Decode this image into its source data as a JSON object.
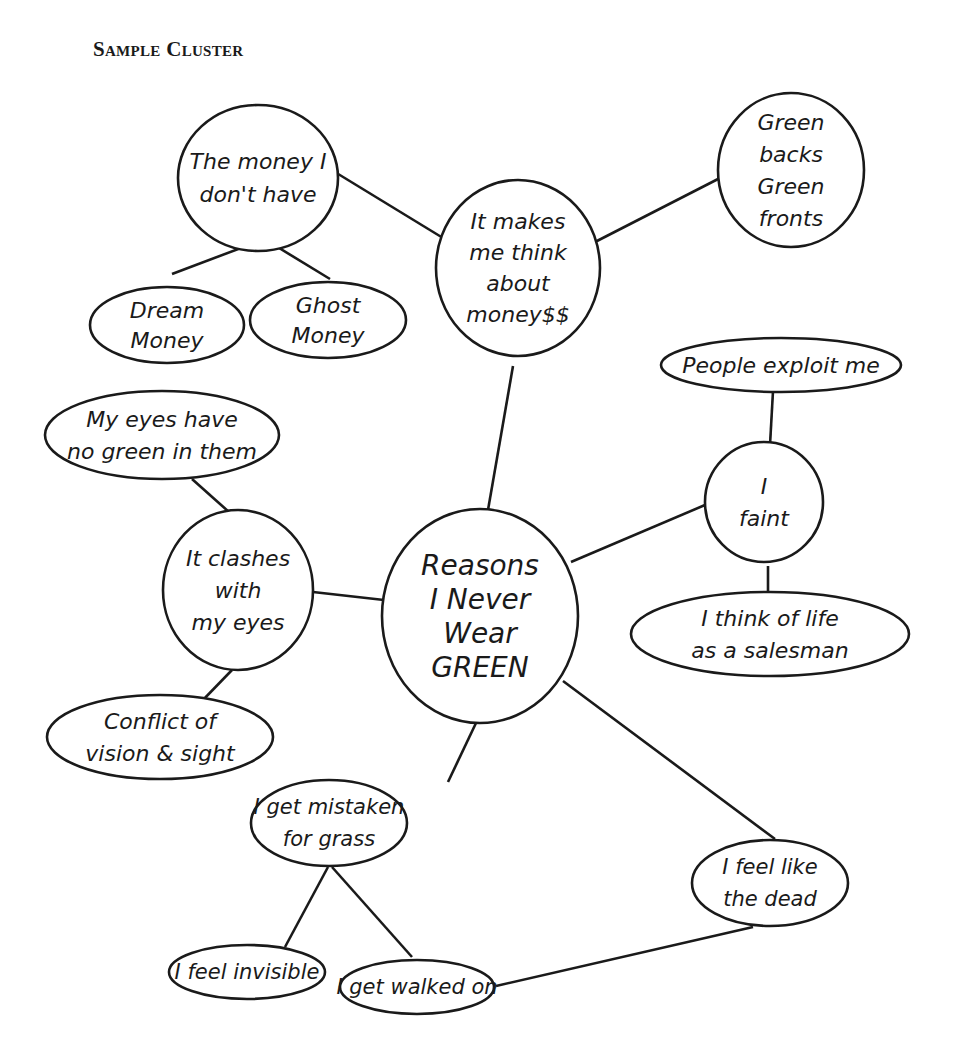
{
  "title": "Sample Cluster",
  "colors": {
    "ink": "#1a1a1a",
    "background": "#ffffff"
  },
  "nodes": [
    {
      "id": "center",
      "lines": [
        "Reasons",
        "I Never",
        "Wear",
        "GREEN"
      ],
      "cx": 480,
      "cy": 616,
      "rx": 98,
      "ry": 107,
      "fs": 28,
      "lh": 34
    },
    {
      "id": "money",
      "lines": [
        "It makes",
        "me think",
        "about",
        "money$$"
      ],
      "cx": 518,
      "cy": 268,
      "rx": 82,
      "ry": 88,
      "fs": 22,
      "lh": 31
    },
    {
      "id": "money-i-dont-have",
      "lines": [
        "The money I",
        "don't have"
      ],
      "cx": 258,
      "cy": 178,
      "rx": 80,
      "ry": 73,
      "fs": 22,
      "lh": 33
    },
    {
      "id": "dream-money",
      "lines": [
        "Dream",
        "Money"
      ],
      "cx": 167,
      "cy": 325,
      "rx": 77,
      "ry": 38,
      "fs": 22,
      "lh": 30
    },
    {
      "id": "ghost-money",
      "lines": [
        "Ghost",
        "Money"
      ],
      "cx": 328,
      "cy": 320,
      "rx": 78,
      "ry": 38,
      "fs": 22,
      "lh": 30
    },
    {
      "id": "green-backs",
      "lines": [
        "Green",
        "backs",
        "Green",
        "fronts"
      ],
      "cx": 791,
      "cy": 170,
      "rx": 73,
      "ry": 77,
      "fs": 22,
      "lh": 32
    },
    {
      "id": "people-exploit",
      "lines": [
        "People exploit me"
      ],
      "cx": 781,
      "cy": 365,
      "rx": 120,
      "ry": 27,
      "fs": 22,
      "lh": 30
    },
    {
      "id": "i-faint",
      "lines": [
        "I",
        "faint"
      ],
      "cx": 764,
      "cy": 502,
      "rx": 59,
      "ry": 60,
      "fs": 22,
      "lh": 32
    },
    {
      "id": "salesman",
      "lines": [
        "I think of life",
        "as a salesman"
      ],
      "cx": 770,
      "cy": 634,
      "rx": 139,
      "ry": 42,
      "fs": 22,
      "lh": 32
    },
    {
      "id": "no-green-eyes",
      "lines": [
        "My eyes have",
        "no green in them"
      ],
      "cx": 162,
      "cy": 435,
      "rx": 117,
      "ry": 44,
      "fs": 22,
      "lh": 32
    },
    {
      "id": "clashes",
      "lines": [
        "It clashes",
        "with",
        "my eyes"
      ],
      "cx": 238,
      "cy": 590,
      "rx": 75,
      "ry": 80,
      "fs": 22,
      "lh": 32
    },
    {
      "id": "conflict",
      "lines": [
        "Conflict of",
        "vision & sight"
      ],
      "cx": 160,
      "cy": 737,
      "rx": 113,
      "ry": 42,
      "fs": 22,
      "lh": 32
    },
    {
      "id": "mistaken-grass",
      "lines": [
        "I get mistaken",
        "for grass"
      ],
      "cx": 329,
      "cy": 823,
      "rx": 78,
      "ry": 43,
      "fs": 21,
      "lh": 32
    },
    {
      "id": "feel-dead",
      "lines": [
        "I feel like",
        "the dead"
      ],
      "cx": 770,
      "cy": 883,
      "rx": 78,
      "ry": 43,
      "fs": 21,
      "lh": 32
    },
    {
      "id": "feel-invisible",
      "lines": [
        "I feel invisible"
      ],
      "cx": 247,
      "cy": 972,
      "rx": 78,
      "ry": 27,
      "fs": 21,
      "lh": 30
    },
    {
      "id": "walked-on",
      "lines": [
        "I get walked on"
      ],
      "cx": 417,
      "cy": 987,
      "rx": 77,
      "ry": 27,
      "fs": 21,
      "lh": 30
    }
  ],
  "edges": [
    {
      "from": "center",
      "to": "money",
      "x1": 488,
      "y1": 510,
      "x2": 513,
      "y2": 366
    },
    {
      "from": "money",
      "to": "money-i-dont-have",
      "x1": 443,
      "y1": 238,
      "x2": 330,
      "y2": 169
    },
    {
      "from": "money",
      "to": "green-backs",
      "x1": 595,
      "y1": 242,
      "x2": 720,
      "y2": 178
    },
    {
      "from": "money-i-dont-have",
      "to": "dream-money",
      "x1": 262,
      "y1": 240,
      "x2": 172,
      "y2": 274
    },
    {
      "from": "money-i-dont-have",
      "to": "ghost-money",
      "x1": 266,
      "y1": 240,
      "x2": 330,
      "y2": 279
    },
    {
      "from": "center",
      "to": "i-faint",
      "x1": 571,
      "y1": 562,
      "x2": 705,
      "y2": 505
    },
    {
      "from": "i-faint",
      "to": "people-exploit",
      "x1": 770,
      "y1": 445,
      "x2": 773,
      "y2": 391
    },
    {
      "from": "i-faint",
      "to": "salesman",
      "x1": 768,
      "y1": 566,
      "x2": 768,
      "y2": 591
    },
    {
      "from": "center",
      "to": "clashes",
      "x1": 384,
      "y1": 600,
      "x2": 313,
      "y2": 592
    },
    {
      "from": "clashes",
      "to": "no-green-eyes",
      "x1": 229,
      "y1": 512,
      "x2": 192,
      "y2": 479
    },
    {
      "from": "clashes",
      "to": "conflict",
      "x1": 232,
      "y1": 670,
      "x2": 201,
      "y2": 702
    },
    {
      "from": "center",
      "to": "mistaken-grass",
      "x1": 476,
      "y1": 723,
      "x2": 448,
      "y2": 782
    },
    {
      "from": "center",
      "to": "feel-dead",
      "x1": 563,
      "y1": 681,
      "x2": 775,
      "y2": 839
    },
    {
      "from": "mistaken-grass",
      "to": "feel-invisible",
      "x1": 328,
      "y1": 867,
      "x2": 285,
      "y2": 947
    },
    {
      "from": "mistaken-grass",
      "to": "walked-on",
      "x1": 332,
      "y1": 867,
      "x2": 412,
      "y2": 957
    },
    {
      "from": "feel-dead",
      "to": "walked-on",
      "x1": 753,
      "y1": 927,
      "x2": 496,
      "y2": 986
    }
  ]
}
